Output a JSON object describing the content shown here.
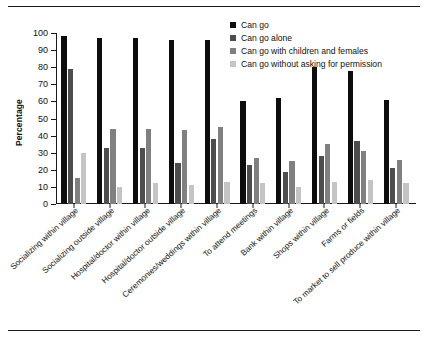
{
  "chart_data": {
    "type": "bar",
    "title": "",
    "xlabel": "",
    "ylabel": "Percentage",
    "ylim": [
      0,
      100
    ],
    "yticks": [
      0,
      10,
      20,
      30,
      40,
      50,
      60,
      70,
      80,
      90,
      100
    ],
    "grid": false,
    "legend_position": "top-right",
    "categories": [
      "Socializing within village",
      "Socializing outside village",
      "Hospital/doctor within village",
      "Hospital/doctor outside village",
      "Ceremonies/weddings within village",
      "To attend meetings",
      "Bank within village",
      "Shops within village",
      "Farms or fields",
      "To market to sell produce within village"
    ],
    "series": [
      {
        "name": "Can go",
        "color": "#0d0d0d",
        "values": [
          98,
          97,
          97,
          96,
          96,
          60,
          62,
          80,
          78,
          61
        ]
      },
      {
        "name": "Can go alone",
        "color": "#4d4d4d",
        "values": [
          79,
          33,
          33,
          24,
          38,
          23,
          19,
          28,
          37,
          21
        ]
      },
      {
        "name": "Can go with children and females",
        "color": "#808080",
        "values": [
          15,
          44,
          44,
          43,
          45,
          27,
          25,
          35,
          31,
          26
        ]
      },
      {
        "name": "Can go without asking for permission",
        "color": "#c4c4c4",
        "values": [
          30,
          10,
          12,
          11,
          13,
          12,
          10,
          13,
          14,
          12
        ]
      }
    ]
  }
}
